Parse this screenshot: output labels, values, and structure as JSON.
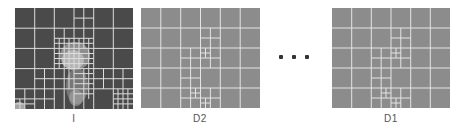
{
  "figure": {
    "panels": [
      {
        "id": "I",
        "label": "I",
        "x": 15,
        "y": 8,
        "width": 118,
        "height": 101,
        "background": "#4a4a4a",
        "grid": {
          "cols": 6,
          "rows": 5
        },
        "line_color": "#dcdcdc",
        "has_image": true
      },
      {
        "id": "D2",
        "label": "D2",
        "x": 141,
        "y": 8,
        "width": 119,
        "height": 100,
        "background": "#8c8c8c",
        "grid": {
          "cols": 6,
          "rows": 5
        },
        "line_color": "#e4e4e4",
        "has_image": false
      },
      {
        "id": "D1",
        "label": "D1",
        "x": 332,
        "y": 8,
        "width": 118,
        "height": 100,
        "background": "#8c8c8c",
        "grid": {
          "cols": 6,
          "rows": 5
        },
        "line_color": "#e4e4e4",
        "has_image": false
      }
    ],
    "ellipsis": {
      "symbol": "• • •",
      "dots_x": [
        281,
        294,
        307
      ],
      "y": 57,
      "color": "#333333"
    }
  }
}
